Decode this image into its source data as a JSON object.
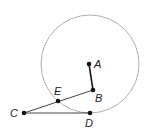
{
  "diagram": {
    "circle": {
      "cx": 90,
      "cy": 64,
      "r": 49,
      "stroke": "#999999"
    },
    "points": {
      "A": {
        "label": "A",
        "x": 89,
        "y": 64
      },
      "B": {
        "label": "B",
        "x": 93,
        "y": 90
      },
      "C": {
        "label": "C",
        "x": 24,
        "y": 113
      },
      "D": {
        "label": "D",
        "x": 90,
        "y": 113
      },
      "E": {
        "label": "E",
        "x": 58,
        "y": 101
      }
    },
    "segments": [
      "AB",
      "BC",
      "CD"
    ]
  }
}
